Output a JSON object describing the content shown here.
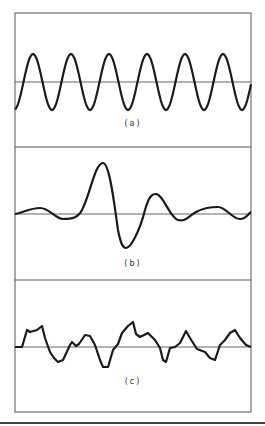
{
  "figure": {
    "colors": {
      "frame": "#555555",
      "axis": "#666666",
      "wave": "#1a1a1a",
      "rule": "#444444"
    },
    "panels": [
      {
        "id": "a",
        "label": "(a)",
        "description": "regular sinusoid",
        "axis_y": 82,
        "label_y": 124
      },
      {
        "id": "b",
        "label": "(b)",
        "description": "damped oscillatory pulse",
        "axis_y": 214,
        "label_y": 264
      },
      {
        "id": "c",
        "label": "(c)",
        "description": "irregular random-like signal",
        "axis_y": 347,
        "label_y": 382
      }
    ]
  }
}
